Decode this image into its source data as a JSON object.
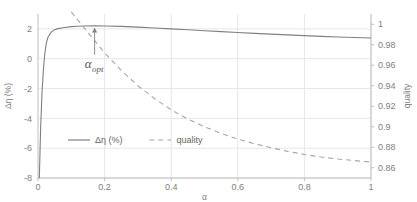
{
  "chart_data": {
    "type": "line",
    "title": "",
    "xlabel": "α",
    "ylabel": "Δη (%)",
    "y2label": "quality",
    "xlim": [
      0,
      1
    ],
    "ylim": [
      -8,
      3
    ],
    "y2lim": [
      0.85,
      1.01
    ],
    "grid": true,
    "legend_position": "center-lower",
    "x_ticks": [
      "0",
      "0.2",
      "0.4",
      "0.6",
      "0.8",
      "1"
    ],
    "x_tick_values": [
      0,
      0.2,
      0.4,
      0.6,
      0.8,
      1
    ],
    "y_ticks": [
      "2",
      "0",
      "-2",
      "-4",
      "-6",
      "-8"
    ],
    "y_tick_values": [
      2,
      0,
      -2,
      -4,
      -6,
      -8
    ],
    "y2_ticks": [
      "1",
      "0.98",
      "0.96",
      "0.94",
      "0.92",
      "0.9",
      "0.88",
      "0.86"
    ],
    "y2_tick_values": [
      1,
      0.98,
      0.96,
      0.94,
      0.92,
      0.9,
      0.88,
      0.86
    ],
    "annotations": [
      {
        "text": "α",
        "sub": "opt",
        "x": 0.17,
        "y": 0.0,
        "arrow_to_y": 2.2
      }
    ],
    "series": [
      {
        "name": "Δη (%)",
        "axis": "left",
        "style": "solid",
        "color": "#808080",
        "x": [
          0.004,
          0.008,
          0.012,
          0.016,
          0.02,
          0.025,
          0.03,
          0.04,
          0.05,
          0.06,
          0.08,
          0.1,
          0.12,
          0.14,
          0.17,
          0.2,
          0.25,
          0.3,
          0.35,
          0.4,
          0.45,
          0.5,
          0.55,
          0.6,
          0.65,
          0.7,
          0.75,
          0.8,
          0.85,
          0.9,
          0.95,
          1.0
        ],
        "values": [
          -8.0,
          -4.6,
          -2.3,
          -0.8,
          0.25,
          1.05,
          1.45,
          1.8,
          1.94,
          2.02,
          2.1,
          2.15,
          2.18,
          2.2,
          2.21,
          2.2,
          2.17,
          2.12,
          2.06,
          2.0,
          1.94,
          1.88,
          1.82,
          1.76,
          1.7,
          1.65,
          1.6,
          1.55,
          1.5,
          1.46,
          1.42,
          1.39
        ]
      },
      {
        "name": "quality",
        "axis": "right",
        "style": "dashed",
        "color": "#a6a6a6",
        "x": [
          0.1,
          0.125,
          0.15,
          0.175,
          0.2,
          0.25,
          0.3,
          0.35,
          0.4,
          0.45,
          0.5,
          0.55,
          0.6,
          0.65,
          0.7,
          0.75,
          0.8,
          0.85,
          0.9,
          0.95,
          1.0
        ],
        "values": [
          1.012,
          1.002,
          0.992,
          0.982,
          0.972,
          0.955,
          0.94,
          0.9275,
          0.9165,
          0.9075,
          0.9,
          0.8935,
          0.888,
          0.8835,
          0.8795,
          0.876,
          0.873,
          0.8705,
          0.8685,
          0.867,
          0.8655
        ]
      }
    ]
  },
  "legend": {
    "items": [
      {
        "label": "Δη (%)",
        "style": "solid"
      },
      {
        "label": "quality",
        "style": "dashed"
      }
    ]
  }
}
